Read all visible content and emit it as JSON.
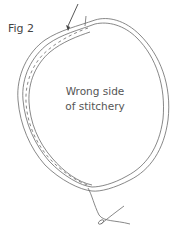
{
  "figure": {
    "label": "Fig 2",
    "center_text_line1": "Wrong side",
    "center_text_line2": "of stitchery"
  },
  "colors": {
    "line": "#6a6a6a",
    "needle": "#444444",
    "text": "#555555"
  },
  "icons": {
    "needle": "needle-icon",
    "thread": "thread-icon"
  }
}
